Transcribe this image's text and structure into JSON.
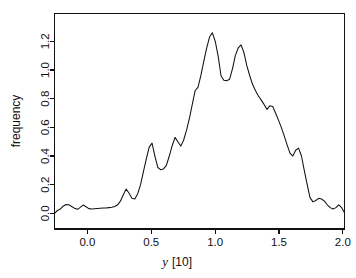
{
  "figure": {
    "background_color": "#ffffff",
    "line_color": "#111111",
    "axis_color": "#111111"
  },
  "axes": {
    "x_title_symbol": "y",
    "x_title_unit": "[10]",
    "x_title_full": "y [10]",
    "y_title": "frequency",
    "x_ticks": [
      "0.0",
      "0.5",
      "1.0",
      "1.5",
      "2.0"
    ],
    "y_ticks": [
      "0.0",
      "0.2",
      "0.4",
      "0.6",
      "0.8",
      "1.0",
      "1.2"
    ]
  },
  "chart_data": {
    "type": "line",
    "title": "",
    "subtitle": "",
    "xlabel": "y [10]",
    "ylabel": "frequency",
    "xlim": [
      -0.258,
      2.013
    ],
    "ylim": [
      -0.109,
      1.394
    ],
    "grid": false,
    "legend": false,
    "legend_position": "none",
    "xticks": [
      0.0,
      0.5,
      1.0,
      1.5,
      2.0
    ],
    "yticks": [
      0.0,
      0.2,
      0.4,
      0.6,
      0.8,
      1.0,
      1.2
    ],
    "series": [
      {
        "name": "frequency",
        "color": "#111111",
        "x": [
          -0.258,
          -0.235,
          -0.213,
          -0.19,
          -0.168,
          -0.146,
          -0.123,
          -0.101,
          -0.078,
          -0.056,
          -0.034,
          -0.011,
          0.011,
          0.034,
          0.056,
          0.078,
          0.101,
          0.123,
          0.146,
          0.168,
          0.19,
          0.213,
          0.235,
          0.258,
          0.281,
          0.303,
          0.326,
          0.348,
          0.371,
          0.393,
          0.416,
          0.438,
          0.461,
          0.483,
          0.506,
          0.528,
          0.551,
          0.573,
          0.596,
          0.618,
          0.641,
          0.663,
          0.686,
          0.708,
          0.731,
          0.753,
          0.776,
          0.798,
          0.821,
          0.843,
          0.866,
          0.888,
          0.911,
          0.933,
          0.956,
          0.978,
          1.001,
          1.023,
          1.046,
          1.068,
          1.091,
          1.113,
          1.136,
          1.158,
          1.181,
          1.203,
          1.226,
          1.248,
          1.271,
          1.293,
          1.316,
          1.338,
          1.361,
          1.383,
          1.406,
          1.428,
          1.451,
          1.473,
          1.496,
          1.518,
          1.541,
          1.563,
          1.586,
          1.608,
          1.631,
          1.653,
          1.676,
          1.698,
          1.721,
          1.743,
          1.766,
          1.788,
          1.811,
          1.833,
          1.856,
          1.878,
          1.901,
          1.923,
          1.946,
          1.968,
          1.991,
          2.013
        ],
        "y": [
          0.0,
          0.02,
          0.03,
          0.05,
          0.062,
          0.06,
          0.048,
          0.035,
          0.028,
          0.042,
          0.058,
          0.046,
          0.033,
          0.03,
          0.032,
          0.034,
          0.036,
          0.038,
          0.038,
          0.04,
          0.042,
          0.048,
          0.058,
          0.085,
          0.13,
          0.17,
          0.14,
          0.105,
          0.1,
          0.135,
          0.2,
          0.29,
          0.38,
          0.46,
          0.49,
          0.4,
          0.32,
          0.305,
          0.31,
          0.335,
          0.4,
          0.47,
          0.53,
          0.5,
          0.47,
          0.51,
          0.58,
          0.66,
          0.76,
          0.855,
          0.88,
          0.96,
          1.06,
          1.15,
          1.23,
          1.26,
          1.2,
          1.1,
          0.96,
          0.928,
          0.925,
          0.935,
          1.01,
          1.1,
          1.155,
          1.175,
          1.12,
          1.03,
          0.96,
          0.9,
          0.855,
          0.82,
          0.79,
          0.76,
          0.725,
          0.75,
          0.745,
          0.7,
          0.65,
          0.6,
          0.54,
          0.48,
          0.42,
          0.4,
          0.44,
          0.455,
          0.4,
          0.3,
          0.2,
          0.11,
          0.08,
          0.09,
          0.105,
          0.1,
          0.085,
          0.06,
          0.04,
          0.03,
          0.04,
          0.06,
          0.04,
          0.005
        ]
      }
    ],
    "annotations": [],
    "peaks": [
      {
        "x": 0.978,
        "y": 1.26,
        "label": "primary peak"
      },
      {
        "x": 1.203,
        "y": 1.175,
        "label": "secondary peak"
      }
    ]
  }
}
